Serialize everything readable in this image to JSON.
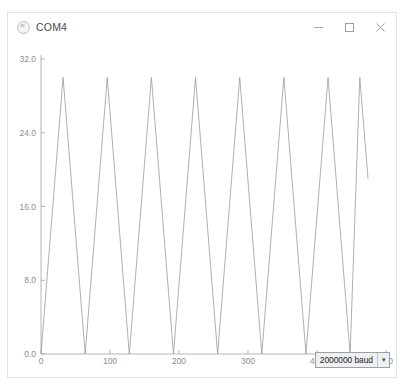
{
  "window": {
    "title": "COM4",
    "icon": "serial-monitor-icon",
    "controls": [
      {
        "name": "minimize-button",
        "glyph": "minimize-icon"
      },
      {
        "name": "maximize-button",
        "glyph": "maximize-icon"
      },
      {
        "name": "close-button",
        "glyph": "close-icon"
      }
    ]
  },
  "footer": {
    "baud_value": "2000000 baud",
    "dropdown_arrow": "chevron-down-icon"
  },
  "chart_data": {
    "type": "line",
    "title": "",
    "xlabel": "",
    "ylabel": "",
    "xlim": [
      0,
      500
    ],
    "ylim": [
      0,
      32
    ],
    "grid": false,
    "legend": "none",
    "line_color": "#9a9a9a",
    "axis_color": "#aeaeae",
    "tick_label_color": "#8d8d8d",
    "xticks": [
      0,
      100,
      200,
      300,
      400,
      500
    ],
    "xtick_labels": [
      "0",
      "100",
      "200",
      "300",
      "400",
      "500"
    ],
    "yticks": [
      0,
      8,
      16,
      24,
      32
    ],
    "ytick_labels": [
      "0.0",
      "8.0",
      "16.0",
      "24.0",
      "32.0"
    ],
    "series": [
      {
        "name": "value",
        "waveform": "triangle",
        "amplitude_min": 0,
        "amplitude_max": 30,
        "period_x": 64,
        "peak_count": 8,
        "points": [
          [
            0,
            0
          ],
          [
            32,
            30
          ],
          [
            64,
            0
          ],
          [
            96,
            30
          ],
          [
            128,
            0
          ],
          [
            160,
            30
          ],
          [
            192,
            0
          ],
          [
            224,
            30
          ],
          [
            256,
            0
          ],
          [
            288,
            30
          ],
          [
            320,
            0
          ],
          [
            352,
            30
          ],
          [
            384,
            0
          ],
          [
            416,
            30
          ],
          [
            448,
            0
          ],
          [
            462,
            30
          ],
          [
            474,
            19
          ]
        ]
      }
    ]
  }
}
